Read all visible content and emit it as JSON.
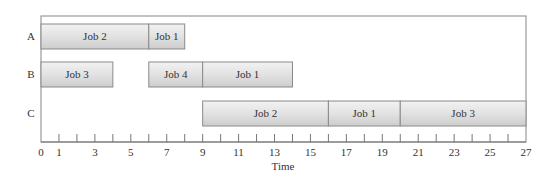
{
  "chart_data": {
    "type": "gantt",
    "title": "",
    "xlabel": "Time",
    "ylabel": "",
    "xlim": [
      0,
      27
    ],
    "x_ticks": [
      0,
      1,
      2,
      3,
      4,
      5,
      6,
      7,
      8,
      9,
      10,
      11,
      12,
      13,
      14,
      15,
      16,
      17,
      18,
      19,
      20,
      21,
      22,
      23,
      24,
      25,
      26,
      27
    ],
    "x_tick_labels": [
      "0",
      "1",
      "3",
      "5",
      "7",
      "9",
      "11",
      "13",
      "15",
      "17",
      "19",
      "21",
      "23",
      "25",
      "27"
    ],
    "grid": false,
    "machines": [
      "A",
      "B",
      "C"
    ],
    "tasks": [
      {
        "machine": "A",
        "label": "Job 2",
        "start": 0,
        "end": 6
      },
      {
        "machine": "A",
        "label": "Job 1",
        "start": 6,
        "end": 8
      },
      {
        "machine": "B",
        "label": "Job 3",
        "start": 0,
        "end": 4
      },
      {
        "machine": "B",
        "label": "Job 4",
        "start": 6,
        "end": 9
      },
      {
        "machine": "B",
        "label": "Job 1",
        "start": 9,
        "end": 14
      },
      {
        "machine": "C",
        "label": "Job 2",
        "start": 9,
        "end": 16
      },
      {
        "machine": "C",
        "label": "Job 1",
        "start": 16,
        "end": 20
      },
      {
        "machine": "C",
        "label": "Job 3",
        "start": 20,
        "end": 27
      }
    ]
  }
}
